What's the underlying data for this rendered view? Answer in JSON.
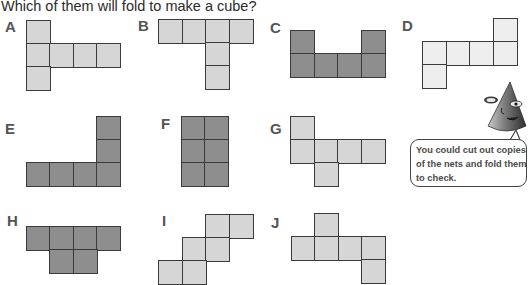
{
  "question": "Which of them will fold to make a cube?",
  "colors": {
    "light": "#d6d6d6",
    "dark": "#8e8e8e",
    "pale": "#eeeeee",
    "border": "#3a3a3a"
  },
  "cell_size": 23.5,
  "nets": [
    {
      "label": "A",
      "shade": "light",
      "label_pos": [
        5,
        18
      ],
      "cells": [
        [
          26,
          20
        ],
        [
          26,
          43
        ],
        [
          49,
          43
        ],
        [
          73,
          43
        ],
        [
          96,
          43
        ],
        [
          26,
          66
        ]
      ]
    },
    {
      "label": "B",
      "shade": "light",
      "label_pos": [
        138,
        17
      ],
      "cells": [
        [
          158,
          19
        ],
        [
          182,
          19
        ],
        [
          205,
          19
        ],
        [
          229,
          19
        ],
        [
          205,
          42
        ],
        [
          205,
          65
        ]
      ]
    },
    {
      "label": "C",
      "shade": "dark",
      "label_pos": [
        270,
        19
      ],
      "cells": [
        [
          290,
          30
        ],
        [
          361,
          30
        ],
        [
          290,
          53
        ],
        [
          314,
          53
        ],
        [
          337,
          53
        ],
        [
          361,
          53
        ]
      ]
    },
    {
      "label": "D",
      "shade": "pale",
      "label_pos": [
        402,
        17
      ],
      "cells": [
        [
          493,
          18
        ],
        [
          422,
          41
        ],
        [
          446,
          41
        ],
        [
          469,
          41
        ],
        [
          493,
          41
        ],
        [
          422,
          64
        ]
      ]
    },
    {
      "label": "E",
      "shade": "dark",
      "label_pos": [
        5,
        120
      ],
      "cells": [
        [
          96,
          116
        ],
        [
          96,
          139
        ],
        [
          26,
          162
        ],
        [
          49,
          162
        ],
        [
          73,
          162
        ],
        [
          96,
          162
        ]
      ]
    },
    {
      "label": "F",
      "shade": "dark",
      "label_pos": [
        161,
        115
      ],
      "cells": [
        [
          181,
          116
        ],
        [
          204,
          116
        ],
        [
          181,
          139
        ],
        [
          204,
          139
        ],
        [
          181,
          162
        ],
        [
          204,
          162
        ]
      ]
    },
    {
      "label": "G",
      "shade": "light",
      "label_pos": [
        270,
        120
      ],
      "cells": [
        [
          290,
          116
        ],
        [
          290,
          139
        ],
        [
          314,
          139
        ],
        [
          337,
          139
        ],
        [
          361,
          139
        ],
        [
          314,
          162
        ]
      ]
    },
    {
      "label": "H",
      "shade": "dark",
      "label_pos": [
        7,
        212
      ],
      "cells": [
        [
          26,
          226
        ],
        [
          49,
          226
        ],
        [
          73,
          226
        ],
        [
          96,
          226
        ],
        [
          49,
          249
        ],
        [
          73,
          249
        ]
      ]
    },
    {
      "label": "I",
      "shade": "light",
      "label_pos": [
        162,
        212
      ],
      "cells": [
        [
          205,
          214
        ],
        [
          229,
          214
        ],
        [
          182,
          237
        ],
        [
          205,
          237
        ],
        [
          158,
          260
        ],
        [
          182,
          260
        ]
      ]
    },
    {
      "label": "J",
      "shade": "light",
      "label_pos": [
        271,
        214
      ],
      "cells": [
        [
          314,
          213
        ],
        [
          291,
          236
        ],
        [
          314,
          236
        ],
        [
          338,
          236
        ],
        [
          361,
          236
        ],
        [
          361,
          259
        ]
      ]
    }
  ],
  "hint": {
    "lines": [
      "You could cut out copies",
      "of the nets and fold them",
      "to check."
    ],
    "character": "cone-character-icon"
  }
}
